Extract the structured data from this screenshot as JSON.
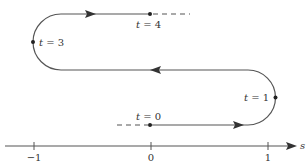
{
  "diagram": {
    "colors": {
      "stroke": "#555555",
      "text": "#333333",
      "background": "#ffffff"
    },
    "axis": {
      "label": "s",
      "ticks": [
        {
          "value": "-1",
          "label": "−1"
        },
        {
          "value": "0",
          "label": "0"
        },
        {
          "value": "1",
          "label": "1"
        }
      ]
    },
    "time_markers": [
      {
        "id": "t0",
        "var": "t",
        "eq": " = ",
        "value": "0"
      },
      {
        "id": "t1",
        "var": "t",
        "eq": " = ",
        "value": "1"
      },
      {
        "id": "t3",
        "var": "t",
        "eq": " = ",
        "value": "3"
      },
      {
        "id": "t4",
        "var": "t",
        "eq": " = ",
        "value": "4"
      }
    ],
    "segments": [
      {
        "from": "t0",
        "to": "t1",
        "direction": "right"
      },
      {
        "from": "t1",
        "to": "t3",
        "direction": "left"
      },
      {
        "from": "t3",
        "to": "t4",
        "direction": "right"
      }
    ]
  }
}
